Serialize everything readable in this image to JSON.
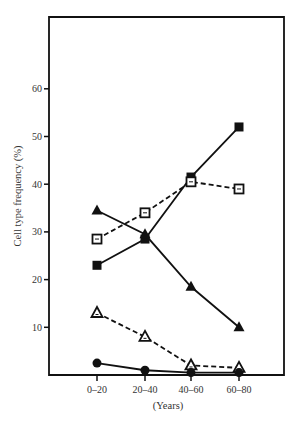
{
  "chart_data": {
    "type": "line",
    "title": "",
    "xlabel": "(Years)",
    "ylabel": "Cell type frequency (%)",
    "categories": [
      "0–20",
      "20–40",
      "40–60",
      "60–80"
    ],
    "yticks": [
      10,
      20,
      30,
      40,
      50,
      60
    ],
    "ylim": [
      0,
      65
    ],
    "grid": false,
    "legend": "none",
    "series": [
      {
        "name": "filled-square",
        "marker": "filled-square",
        "line": "solid",
        "values": [
          23,
          28.5,
          41.5,
          52
        ]
      },
      {
        "name": "open-square",
        "marker": "open-square",
        "line": "dashed",
        "values": [
          28.5,
          34,
          40.5,
          39
        ]
      },
      {
        "name": "filled-triangle",
        "marker": "filled-triangle",
        "line": "solid",
        "values": [
          34.5,
          29.5,
          18.5,
          10
        ]
      },
      {
        "name": "open-triangle",
        "marker": "open-triangle",
        "line": "dashed",
        "values": [
          13,
          8,
          2,
          1.5
        ]
      },
      {
        "name": "filled-circle",
        "marker": "filled-circle",
        "line": "solid",
        "values": [
          2.5,
          1,
          0.5,
          0.5
        ]
      }
    ]
  },
  "colors": {
    "ink": "#111111",
    "background": "#ffffff"
  }
}
